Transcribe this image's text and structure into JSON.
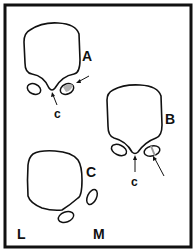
{
  "figure": {
    "panels": [
      {
        "id": "A",
        "label": "A",
        "sublabel": "c",
        "shaded_oval": "right",
        "arrow_to_oval": true
      },
      {
        "id": "B",
        "label": "B",
        "sublabel": "c",
        "shaded_oval": "right-striped",
        "arrow_to_oval": true
      },
      {
        "id": "C",
        "label": "C",
        "side_labels": {
          "left": "L",
          "right": "M"
        }
      }
    ],
    "colors": {
      "stroke": "#111111",
      "shade": "#b0b0b0",
      "background": "#ffffff"
    }
  }
}
